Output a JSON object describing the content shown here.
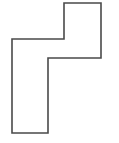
{
  "figure": {
    "name": "polygon-outline",
    "background_color": "#ffffff",
    "stroke_color": "#4a4a4a",
    "fill_color": "none",
    "stroke_width": 1.6,
    "canvas": {
      "width": 119,
      "height": 143
    },
    "points": "64,3 101,3 101,58 48,58 48,133 12,133 12,39 64,39",
    "vertices": [
      {
        "x": 64,
        "y": 3
      },
      {
        "x": 101,
        "y": 3
      },
      {
        "x": 101,
        "y": 58
      },
      {
        "x": 48,
        "y": 58
      },
      {
        "x": 48,
        "y": 133
      },
      {
        "x": 12,
        "y": 133
      },
      {
        "x": 12,
        "y": 39
      },
      {
        "x": 64,
        "y": 39
      }
    ]
  }
}
